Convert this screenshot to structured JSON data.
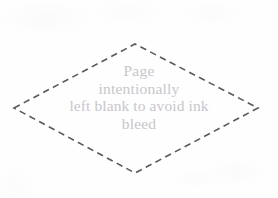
{
  "page": {
    "width": 278,
    "height": 198,
    "background_color": "#fefefe",
    "kind": "scanned-book-filler-page"
  },
  "notice": {
    "lines": [
      "Page",
      "intentionally",
      "left blank to avoid ink",
      "bleed"
    ],
    "full_text": "Page intentionally left blank to avoid ink bleed",
    "text_color": "#c9c6cb",
    "align": "center"
  },
  "decoration": {
    "shape_name": "dashed-diamond-border",
    "shape": "diamond",
    "stroke_color": "#4b4a50",
    "stroke_width": 1.6,
    "dash_length": 6.5,
    "dash_gap": 4.5,
    "vertices": {
      "left": {
        "x": 14,
        "y": 108
      },
      "top": {
        "x": 135,
        "y": 44
      },
      "right": {
        "x": 258,
        "y": 108
      },
      "bottom": {
        "x": 135,
        "y": 173
      }
    }
  }
}
